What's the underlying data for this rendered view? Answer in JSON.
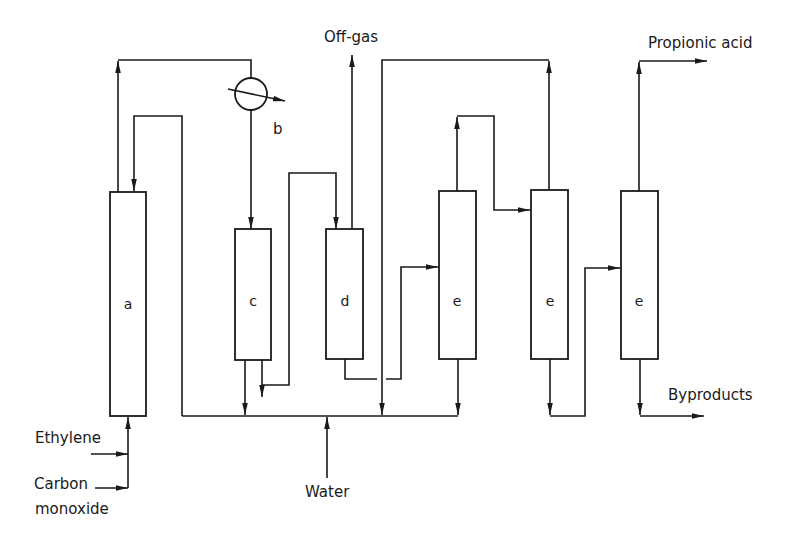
{
  "diagram": {
    "type": "process-flow",
    "colors": {
      "stroke": "#1a1a1a",
      "background": "#ffffff"
    },
    "vessels": [
      {
        "id": "a",
        "label": "a"
      },
      {
        "id": "c",
        "label": "c"
      },
      {
        "id": "d",
        "label": "d"
      },
      {
        "id": "e1",
        "label": "e"
      },
      {
        "id": "e2",
        "label": "e"
      },
      {
        "id": "e3",
        "label": "e"
      }
    ],
    "heat_exchanger": {
      "id": "b",
      "label": "b"
    },
    "streams": {
      "off_gas": "Off-gas",
      "propionic_acid": "Propionic acid",
      "byproducts": "Byproducts",
      "ethylene": "Ethylene",
      "carbon_monoxide_line1": "Carbon",
      "carbon_monoxide_line2": "monoxide",
      "water": "Water"
    }
  }
}
